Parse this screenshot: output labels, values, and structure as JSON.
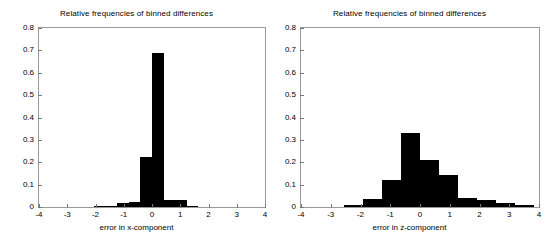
{
  "figure": {
    "background": "#ffffff",
    "bar_color": "#000000",
    "axis_color": "#999999"
  },
  "panels": [
    {
      "key": "x_component",
      "title": "Relative frequencies of binned differences",
      "xlabel": "error in x-component",
      "ylabel": "",
      "xticks": [
        "-4",
        "-3",
        "-2",
        "-1",
        "0",
        "1",
        "2",
        "3",
        "4"
      ],
      "yticks": [
        "0",
        "0.1",
        "0.2",
        "0.3",
        "0.4",
        "0.5",
        "0.6",
        "0.7",
        "0.8"
      ]
    },
    {
      "key": "z_component",
      "title": "Relative frequencies of binned differences",
      "xlabel": "error in z-component",
      "ylabel": "",
      "xticks": [
        "-4",
        "-3",
        "-2",
        "-1",
        "0",
        "1",
        "2",
        "3",
        "4"
      ],
      "yticks": [
        "0",
        "0.1",
        "0.2",
        "0.3",
        "0.4",
        "0.5",
        "0.6",
        "0.7",
        "0.8"
      ]
    }
  ],
  "chart_data": [
    {
      "type": "bar",
      "title": "Relative frequencies of binned differences",
      "xlabel": "error in x-component",
      "ylabel": "",
      "xlim": [
        -4,
        4
      ],
      "ylim": [
        0,
        0.8
      ],
      "xtick_values": [
        -4,
        -3,
        -2,
        -1,
        0,
        1,
        2,
        3,
        4
      ],
      "ytick_values": [
        0,
        0.1,
        0.2,
        0.3,
        0.4,
        0.5,
        0.6,
        0.7,
        0.8
      ],
      "grid": false,
      "legend": "none",
      "bin_width": 0.4125,
      "bin_edges": [
        -2.06,
        -1.65,
        -1.24,
        -0.83,
        -0.41,
        0.0,
        0.41,
        0.83,
        1.24,
        1.65
      ],
      "bin_centers": [
        -1.86,
        -1.44,
        -1.03,
        -0.62,
        -0.21,
        0.21,
        0.62,
        1.03,
        1.44
      ],
      "values": [
        0.004,
        0.004,
        0.02,
        0.022,
        0.223,
        0.69,
        0.03,
        0.03,
        0.006
      ]
    },
    {
      "type": "bar",
      "title": "Relative frequencies of binned differences",
      "xlabel": "error in z-component",
      "ylabel": "",
      "xlim": [
        -4,
        4
      ],
      "ylim": [
        0,
        0.8
      ],
      "xtick_values": [
        -4,
        -3,
        -2,
        -1,
        0,
        1,
        2,
        3,
        4
      ],
      "ytick_values": [
        0,
        0.1,
        0.2,
        0.3,
        0.4,
        0.5,
        0.6,
        0.7,
        0.8
      ],
      "grid": false,
      "legend": "none",
      "bin_width": 0.64,
      "bin_edges": [
        -2.56,
        -1.92,
        -1.28,
        -0.64,
        0.0,
        0.64,
        1.28,
        1.92,
        2.56,
        3.2,
        3.84
      ],
      "bin_centers": [
        -2.24,
        -1.6,
        -0.96,
        -0.32,
        0.32,
        0.96,
        1.6,
        2.24,
        2.88,
        3.52
      ],
      "values": [
        0.008,
        0.037,
        0.121,
        0.329,
        0.209,
        0.145,
        0.042,
        0.032,
        0.016,
        0.009
      ]
    }
  ]
}
